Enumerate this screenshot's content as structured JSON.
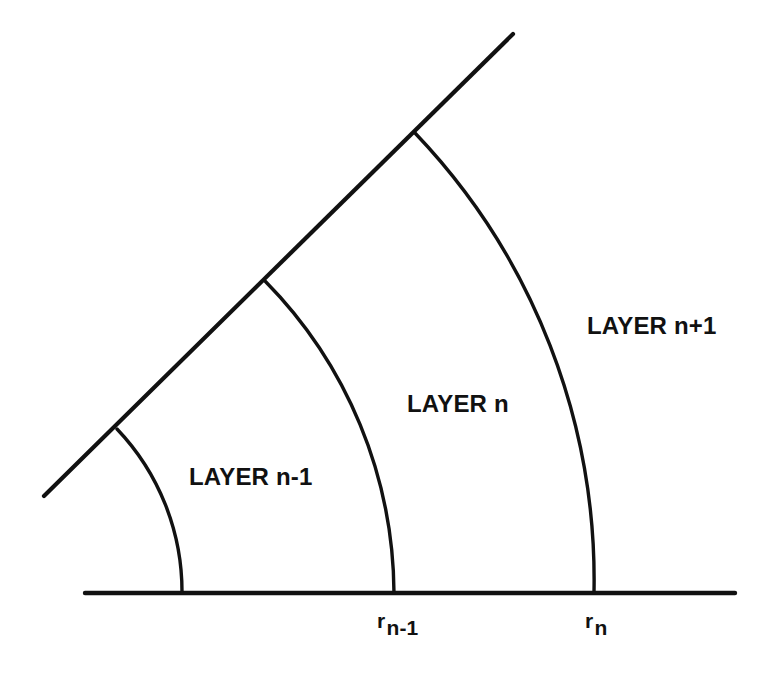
{
  "figure": {
    "type": "geometry-diagram",
    "background_color": "#ffffff",
    "line_color": "#111111"
  },
  "labels": {
    "layer_inner": "LAYER n-1",
    "layer_middle": "LAYER n",
    "layer_outer": "LAYER n+1",
    "radius_inner": {
      "symbol": "r",
      "subscript": "n-1"
    },
    "radius_outer": {
      "symbol": "r",
      "subscript": "n"
    }
  },
  "geometry": {
    "origin": {
      "x": -54,
      "y": 593
    },
    "baseline": {
      "x1": 85,
      "y1": 593,
      "x2": 735,
      "y2": 593
    },
    "ray": {
      "x1": 44,
      "y1": 496,
      "x2": 513,
      "y2": 34
    },
    "arcs": [
      {
        "name": "arc-r-n-minus-2",
        "radius": 236,
        "baseline_x": 182,
        "ray_point": {
          "x": 117,
          "y": 429
        }
      },
      {
        "name": "arc-r-n-minus-1",
        "radius": 448,
        "baseline_x": 394,
        "ray_point": {
          "x": 265,
          "y": 281
        }
      },
      {
        "name": "arc-r-n",
        "radius": 648,
        "baseline_x": 594,
        "ray_point": {
          "x": 415,
          "y": 133
        }
      }
    ],
    "sector_angle_degrees": 45
  }
}
